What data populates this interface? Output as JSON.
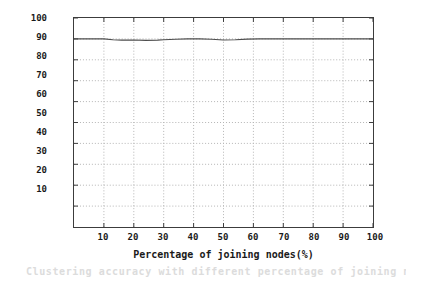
{
  "chart_data": {
    "type": "line",
    "title": "",
    "xlabel": "Percentage of joining nodes(%)",
    "ylabel": "Clustering accuracy(%)",
    "xlim": [
      0,
      100
    ],
    "ylim": [
      0,
      100
    ],
    "xticks": [
      10,
      20,
      30,
      40,
      50,
      60,
      70,
      80,
      90,
      100
    ],
    "xtick_labels": [
      "10",
      "20",
      "30",
      "40",
      "50",
      "60",
      "70",
      "80",
      "90",
      "100"
    ],
    "yticks": [
      10,
      20,
      30,
      40,
      50,
      60,
      70,
      80,
      90,
      100
    ],
    "ytick_labels": [
      "10",
      "20",
      "30",
      "40",
      "50",
      "60",
      "70",
      "80",
      "90",
      "100"
    ],
    "grid": true,
    "grid_style": "dotted",
    "grid_color": "#b4b4b4",
    "legend": null,
    "line_color": "#4d4d4d",
    "axis_color": "#3c3c3c",
    "series": [
      {
        "name": "Clustering accuracy",
        "x": [
          0,
          5,
          10,
          13,
          16,
          20,
          24,
          28,
          30,
          34,
          38,
          42,
          46,
          50,
          54,
          58,
          62,
          66,
          70,
          74,
          78,
          82,
          86,
          90,
          94,
          97,
          100
        ],
        "values": [
          90.0,
          90.0,
          90.0,
          89.6,
          89.4,
          89.5,
          89.3,
          89.4,
          89.6,
          89.8,
          90.0,
          90.0,
          89.8,
          89.5,
          89.6,
          89.9,
          90.0,
          90.0,
          90.0,
          90.0,
          90.0,
          90.0,
          90.0,
          90.0,
          90.0,
          90.0,
          90.0
        ]
      }
    ]
  },
  "caption_ghost": "Clustering accuracy with different percentage of joining nodes"
}
